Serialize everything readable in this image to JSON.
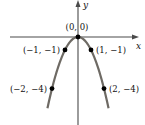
{
  "chart_data": {
    "type": "line",
    "title": "",
    "function": "y = -x^2",
    "xlabel": "x",
    "ylabel": "y",
    "grid": false,
    "xlim": [
      -5.3,
      4.6
    ],
    "ylim": [
      -6.8,
      2.8
    ],
    "curve": {
      "color": "#6e6a64",
      "x_range": [
        -2.35,
        2.35
      ]
    },
    "points": [
      {
        "x": 0,
        "y": 0,
        "label": "(0, 0)",
        "label_pos": "above-left"
      },
      {
        "x": -1,
        "y": -1,
        "label": "(−1, −1)",
        "label_pos": "left"
      },
      {
        "x": 1,
        "y": -1,
        "label": "(1, −1)",
        "label_pos": "right"
      },
      {
        "x": -2,
        "y": -4,
        "label": "(−2, −4)",
        "label_pos": "left"
      },
      {
        "x": 2,
        "y": -4,
        "label": "(2, −4)",
        "label_pos": "right"
      }
    ],
    "colors": {
      "axis": "#4a4a4a",
      "point": "#000000",
      "text": "#111111"
    }
  }
}
